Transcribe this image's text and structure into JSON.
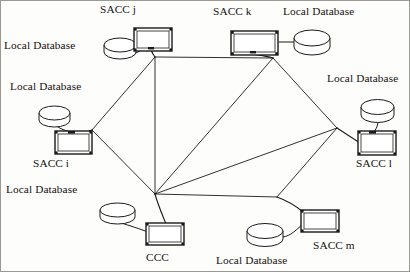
{
  "diagram": {
    "stroke_color": "#1a1a1a",
    "fill_color": "#ffffff",
    "background_color": "#fdfdfc",
    "labels": [
      {
        "id": "label-sacc-j",
        "text": "SACC j",
        "x": 100,
        "y": 4
      },
      {
        "id": "label-sacc-k",
        "text": "SACC k",
        "x": 213,
        "y": 6
      },
      {
        "id": "label-db-top-right",
        "text": "Local Database",
        "x": 283,
        "y": 6
      },
      {
        "id": "label-db-top-left",
        "text": "Local Database",
        "x": 4,
        "y": 40
      },
      {
        "id": "label-db-mid-left",
        "text": "Local Database",
        "x": 10,
        "y": 81
      },
      {
        "id": "label-db-mid-right",
        "text": "Local Database",
        "x": 327,
        "y": 73
      },
      {
        "id": "label-sacc-i",
        "text": "SACC i",
        "x": 33,
        "y": 158
      },
      {
        "id": "label-sacc-l",
        "text": "SACC l",
        "x": 356,
        "y": 158
      },
      {
        "id": "label-db-low-left",
        "text": "Local Database",
        "x": 6,
        "y": 184
      },
      {
        "id": "label-ccc",
        "text": "CCC",
        "x": 146,
        "y": 252
      },
      {
        "id": "label-db-bottom",
        "text": "Local Database",
        "x": 216,
        "y": 255
      },
      {
        "id": "label-sacc-m",
        "text": "SACC m",
        "x": 313,
        "y": 240
      }
    ],
    "nodes": [
      {
        "id": "node-sacc-j",
        "name": "SACC j",
        "type": "computer",
        "x": 134,
        "y": 28,
        "w": 38,
        "h": 23
      },
      {
        "id": "node-sacc-k",
        "name": "SACC k",
        "type": "computer",
        "x": 231,
        "y": 31,
        "w": 47,
        "h": 24
      },
      {
        "id": "node-sacc-i",
        "name": "SACC i",
        "type": "computer",
        "x": 55,
        "y": 131,
        "w": 37,
        "h": 23
      },
      {
        "id": "node-sacc-l",
        "name": "SACC l",
        "type": "computer",
        "x": 358,
        "y": 131,
        "w": 38,
        "h": 24
      },
      {
        "id": "node-ccc",
        "name": "CCC",
        "type": "computer",
        "x": 146,
        "y": 223,
        "w": 38,
        "h": 22
      },
      {
        "id": "node-sacc-m",
        "name": "SACC m",
        "type": "computer",
        "x": 301,
        "y": 210,
        "w": 38,
        "h": 22
      }
    ],
    "databases": [
      {
        "id": "db-sacc-j",
        "attached_to": "SACC j",
        "x": 104,
        "y": 38,
        "w": 32,
        "h": 22
      },
      {
        "id": "db-sacc-k",
        "attached_to": "SACC k",
        "x": 294,
        "y": 30,
        "w": 36,
        "h": 25
      },
      {
        "id": "db-sacc-i",
        "attached_to": "SACC i",
        "x": 39,
        "y": 106,
        "w": 31,
        "h": 22
      },
      {
        "id": "db-sacc-l",
        "attached_to": "SACC l",
        "x": 361,
        "y": 100,
        "w": 33,
        "h": 23
      },
      {
        "id": "db-ccc",
        "attached_to": "CCC",
        "x": 100,
        "y": 203,
        "w": 35,
        "h": 22
      },
      {
        "id": "db-sacc-m",
        "attached_to": "SACC m",
        "x": 247,
        "y": 224,
        "w": 36,
        "h": 23
      }
    ],
    "junctions": [
      {
        "id": "junction-j",
        "near": "SACC j",
        "x": 155,
        "y": 57
      },
      {
        "id": "junction-k",
        "near": "SACC k",
        "x": 273,
        "y": 58
      },
      {
        "id": "junction-i",
        "near": "SACC i",
        "x": 92,
        "y": 130
      },
      {
        "id": "junction-l",
        "near": "SACC l",
        "x": 337,
        "y": 128
      },
      {
        "id": "junction-c",
        "near": "CCC",
        "x": 155,
        "y": 194
      },
      {
        "id": "junction-m",
        "near": "SACC m",
        "x": 277,
        "y": 197
      }
    ],
    "links": [
      {
        "id": "link-j-k",
        "from": "junction-j",
        "to": "junction-k"
      },
      {
        "id": "link-j-i",
        "from": "junction-j",
        "to": "junction-i"
      },
      {
        "id": "link-j-c",
        "from": "junction-j",
        "to": "junction-c"
      },
      {
        "id": "link-k-c",
        "from": "junction-k",
        "to": "junction-c"
      },
      {
        "id": "link-k-l",
        "from": "junction-k",
        "to": "junction-l"
      },
      {
        "id": "link-i-c",
        "from": "junction-i",
        "to": "junction-c"
      },
      {
        "id": "link-l-c",
        "from": "junction-l",
        "to": "junction-c"
      },
      {
        "id": "link-l-m",
        "from": "junction-l",
        "to": "junction-m"
      },
      {
        "id": "link-c-m",
        "from": "junction-c",
        "to": "junction-m"
      }
    ],
    "node_links": [
      {
        "id": "nodelink-j",
        "node": "SACC j",
        "junction": "junction-j"
      },
      {
        "id": "nodelink-k",
        "node": "SACC k",
        "junction": "junction-k"
      },
      {
        "id": "nodelink-i",
        "node": "SACC i",
        "junction": "junction-i"
      },
      {
        "id": "nodelink-l",
        "node": "SACC l",
        "junction": "junction-l"
      },
      {
        "id": "nodelink-c",
        "node": "CCC",
        "junction": "junction-c"
      },
      {
        "id": "nodelink-m",
        "node": "SACC m",
        "junction": "junction-m"
      }
    ]
  }
}
